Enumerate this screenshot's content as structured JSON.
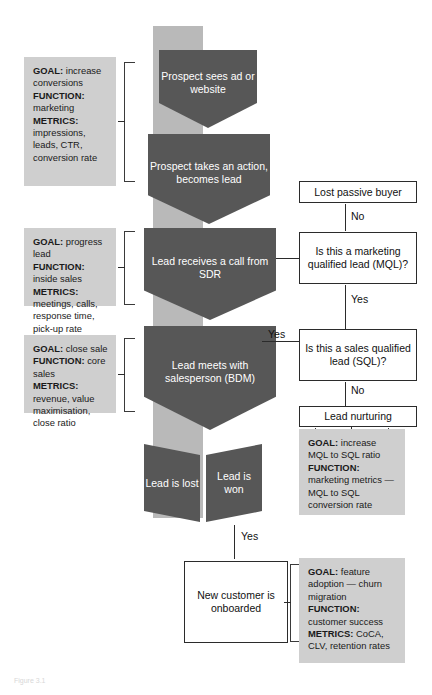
{
  "funnel": {
    "stages": [
      {
        "id": "stage-1",
        "label": "Prospect sees ad or website"
      },
      {
        "id": "stage-2",
        "label": "Prospect takes an action, becomes lead"
      },
      {
        "id": "stage-3",
        "label": "Lead receives a call from SDR"
      },
      {
        "id": "stage-4",
        "label": "Lead meets with salesperson (BDM)"
      }
    ],
    "outcomes": [
      {
        "id": "outcome-lost",
        "label": "Lead is lost"
      },
      {
        "id": "outcome-won",
        "label": "Lead is won"
      }
    ]
  },
  "annotations": {
    "marketing": {
      "goal_key": "GOAL:",
      "goal_value": " increase conversions",
      "function_key": "FUNCTION:",
      "function_value": " marketing",
      "metrics_key": "METRICS:",
      "metrics_value": " impressions, leads, CTR, conversion rate"
    },
    "inside_sales": {
      "goal_key": "GOAL:",
      "goal_value": " progress lead",
      "function_key": "FUNCTION:",
      "function_value": " inside sales",
      "metrics_key": "METRICS:",
      "metrics_value": " meetings, calls, response time, pick-up rate"
    },
    "core_sales": {
      "goal_key": "GOAL:",
      "goal_value": " close sale",
      "function_key": "FUNCTION:",
      "function_value": " core sales",
      "metrics_key": "METRICS:",
      "metrics_value": " revenue, value maximisation, close ratio"
    },
    "nurturing": {
      "goal_key": "GOAL:",
      "goal_value": " increase MQL to SQL ratio",
      "function_key": "FUNCTION:",
      "function_value": " marketing metrics — MQL to SQL conversion rate"
    },
    "customer_success": {
      "goal_key": "GOAL:",
      "goal_value": " feature adoption — churn migration",
      "function_key": "FUNCTION:",
      "function_value": " customer success",
      "metrics_key": "METRICS:",
      "metrics_value": " CoCA, CLV, retention rates"
    }
  },
  "decisions": {
    "lost_passive_buyer": "Lost passive buyer",
    "mql_question": "Is this a marketing qualified lead (MQL)?",
    "sql_question": "Is this a sales qualified lead (SQL)?",
    "lead_nurturing": "Lead nurturing",
    "new_customer": "New customer is onboarded"
  },
  "connector_labels": {
    "no_to_lost": "No",
    "yes_to_sql": "Yes",
    "yes_from_bdm": "Yes",
    "no_to_nurturing": "No",
    "yes_to_onboard": "Yes"
  },
  "caption": "Figure 3.1",
  "colors": {
    "funnel_spine": "#b9b9b9",
    "funnel_stage": "#575757",
    "annotation_bg": "#cfcfcf",
    "line": "#2b2b2b",
    "stage_text": "#ffffff"
  }
}
